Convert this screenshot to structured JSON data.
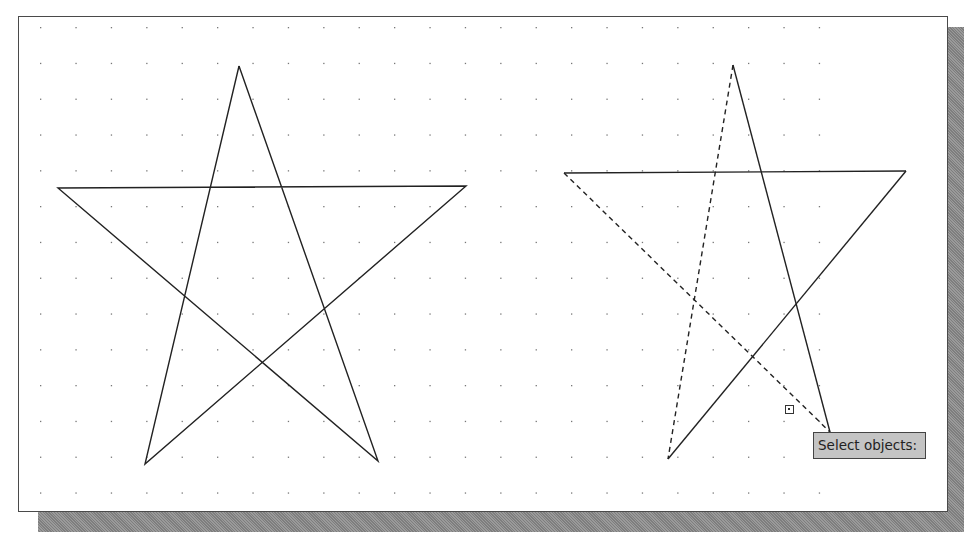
{
  "app": {
    "view": "drawing-area",
    "grid": {
      "visible": true,
      "spacing_x": 35.4,
      "spacing_y": 35.8,
      "origin_x": 40,
      "origin_y": 27,
      "dot_color": "#777777"
    }
  },
  "objects": {
    "left_star": {
      "label": "Star (original)",
      "points": [
        [
          239,
          66
        ],
        [
          145,
          464
        ],
        [
          466,
          186
        ],
        [
          58,
          188
        ],
        [
          378,
          461
        ],
        [
          239,
          66
        ]
      ]
    },
    "right_star": {
      "label": "Star (partially selected)",
      "segments": [
        {
          "from": [
            733,
            65
          ],
          "to": [
            830,
            432
          ],
          "style": "solid",
          "selected": false
        },
        {
          "from": [
            564,
            173
          ],
          "to": [
            906,
            171
          ],
          "style": "solid",
          "selected": false
        },
        {
          "from": [
            906,
            171
          ],
          "to": [
            668,
            459
          ],
          "style": "solid",
          "selected": false
        },
        {
          "from": [
            733,
            65
          ],
          "to": [
            668,
            459
          ],
          "style": "dashed",
          "selected": true
        },
        {
          "from": [
            564,
            173
          ],
          "to": [
            830,
            432
          ],
          "style": "dashed",
          "selected": true
        }
      ]
    }
  },
  "cursor": {
    "type": "pickbox",
    "x": 789,
    "y": 409
  },
  "prompt": {
    "tooltip_text": "Select objects:"
  },
  "colors": {
    "line": "#222222",
    "tooltip_bg": "#c4c4c4",
    "shadow": "#8a8a8a"
  }
}
